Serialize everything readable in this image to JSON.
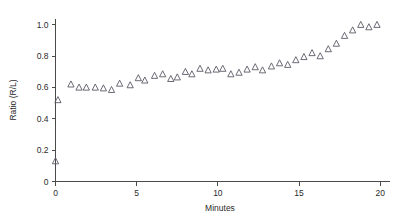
{
  "chart_data": {
    "type": "scatter",
    "title": "",
    "xlabel": "Minutes",
    "ylabel": "Ratio (R/L)",
    "xlim": [
      0,
      20.6
    ],
    "ylim": [
      0,
      1.04
    ],
    "xticks": [
      0,
      5,
      10,
      15,
      20
    ],
    "xtick_labels": [
      "0",
      "5",
      "10",
      "15",
      "20"
    ],
    "yticks": [
      0,
      0.2,
      0.4,
      0.6,
      0.8,
      1.0
    ],
    "ytick_labels": [
      "0",
      "0.2",
      "0.4",
      "0.6",
      "0.8",
      "1.0"
    ],
    "grid": false,
    "legend": null,
    "marker": "triangle-up-open",
    "marker_color": "#5a5a66",
    "axis_color": "#4a4a4a",
    "series": [
      {
        "name": "Ratio (R/L)",
        "x": [
          0.0,
          0.15,
          0.95,
          1.45,
          1.9,
          2.45,
          2.95,
          3.45,
          3.95,
          4.6,
          5.1,
          5.5,
          6.1,
          6.6,
          7.1,
          7.5,
          8.0,
          8.4,
          8.9,
          9.4,
          9.9,
          10.3,
          10.8,
          11.3,
          11.8,
          12.3,
          12.75,
          13.3,
          13.8,
          14.3,
          14.8,
          15.3,
          15.8,
          16.3,
          16.8,
          17.3,
          17.8,
          18.3,
          18.8,
          19.3,
          19.8
        ],
        "y": [
          0.13,
          0.52,
          0.62,
          0.6,
          0.6,
          0.6,
          0.595,
          0.585,
          0.625,
          0.615,
          0.66,
          0.645,
          0.675,
          0.685,
          0.655,
          0.665,
          0.7,
          0.685,
          0.72,
          0.71,
          0.715,
          0.72,
          0.685,
          0.695,
          0.715,
          0.73,
          0.71,
          0.735,
          0.755,
          0.745,
          0.775,
          0.795,
          0.82,
          0.8,
          0.845,
          0.88,
          0.93,
          0.965,
          1.0,
          0.985,
          1.0
        ]
      }
    ]
  }
}
